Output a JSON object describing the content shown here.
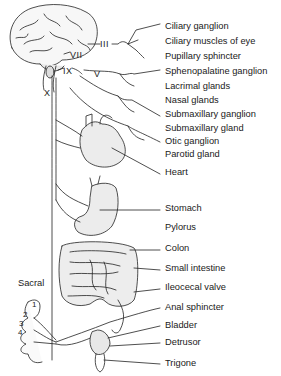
{
  "figure": {
    "nerve_labels": {
      "III": "III",
      "VII": "VII",
      "IX": "IX",
      "V": "V",
      "X": "X"
    },
    "region_labels": {
      "sacral": "Sacral",
      "s1": "1",
      "s2": "2",
      "s3": "3",
      "s4": "4"
    },
    "organ_labels": [
      {
        "text": "Ciliary ganglion",
        "y": 26
      },
      {
        "text": "Ciliary muscles of eye",
        "y": 41
      },
      {
        "text": "Pupillary sphincter",
        "y": 56
      },
      {
        "text": "Sphenopalatine ganglion",
        "y": 71
      },
      {
        "text": "Lacrimal glands",
        "y": 86
      },
      {
        "text": "Nasal glands",
        "y": 100
      },
      {
        "text": "Submaxillary ganglion",
        "y": 114
      },
      {
        "text": "Submaxillary gland",
        "y": 128
      },
      {
        "text": "Otic ganglion",
        "y": 141
      },
      {
        "text": "Parotid gland",
        "y": 154
      },
      {
        "text": "Heart",
        "y": 172
      },
      {
        "text": "Stomach",
        "y": 208
      },
      {
        "text": "Pylorus",
        "y": 227
      },
      {
        "text": "Colon",
        "y": 248
      },
      {
        "text": "Small intestine",
        "y": 268
      },
      {
        "text": "Ileocecal valve",
        "y": 287
      },
      {
        "text": "Anal sphincter",
        "y": 307
      },
      {
        "text": "Bladder",
        "y": 325
      },
      {
        "text": "Detrusor",
        "y": 342
      },
      {
        "text": "Trigone",
        "y": 363
      }
    ]
  }
}
